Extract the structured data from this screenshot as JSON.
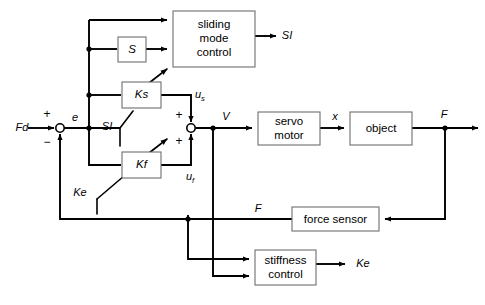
{
  "diagram": {
    "type": "control-system-block-diagram",
    "width": 485,
    "height": 305,
    "background_color": "#ffffff",
    "line_color": "#000000",
    "box_stroke_color": "#6e6e6e",
    "blocks": [
      {
        "id": "sliding-mode-control",
        "label_lines": [
          "sliding",
          "mode",
          "control"
        ],
        "x": 173,
        "y": 11,
        "w": 82,
        "h": 56
      },
      {
        "id": "s-block",
        "label_lines": [
          "S"
        ],
        "x": 118,
        "y": 37,
        "w": 28,
        "h": 25
      },
      {
        "id": "ks-block",
        "label_lines": [
          "Ks"
        ],
        "x": 122,
        "y": 82,
        "w": 39,
        "h": 26
      },
      {
        "id": "kf-block",
        "label_lines": [
          "Kf"
        ],
        "x": 122,
        "y": 152,
        "w": 39,
        "h": 26
      },
      {
        "id": "servo-motor",
        "label_lines": [
          "servo",
          "motor"
        ],
        "x": 258,
        "y": 112,
        "w": 62,
        "h": 33
      },
      {
        "id": "object",
        "label_lines": [
          "object"
        ],
        "x": 350,
        "y": 112,
        "w": 62,
        "h": 33
      },
      {
        "id": "force-sensor",
        "label_lines": [
          "force sensor"
        ],
        "x": 292,
        "y": 207,
        "w": 87,
        "h": 24
      },
      {
        "id": "stiffness-control",
        "label_lines": [
          "stiffness",
          "control"
        ],
        "x": 255,
        "y": 250,
        "w": 61,
        "h": 35
      }
    ],
    "signals": [
      {
        "id": "Fd",
        "label": "Fd",
        "x": 22,
        "y": 128
      },
      {
        "id": "e",
        "label": "e",
        "x": 75,
        "y": 119
      },
      {
        "id": "SI-out",
        "label": "SI",
        "x": 285,
        "y": 36
      },
      {
        "id": "SI-switch",
        "label": "SI",
        "x": 107,
        "y": 127
      },
      {
        "id": "us",
        "label": "u",
        "sub": "s",
        "x": 198,
        "y": 95
      },
      {
        "id": "uf",
        "label": "u",
        "sub": "f",
        "x": 190,
        "y": 177
      },
      {
        "id": "V",
        "label": "V",
        "x": 226,
        "y": 118
      },
      {
        "id": "x",
        "label": "x",
        "x": 335,
        "y": 118
      },
      {
        "id": "F-out",
        "label": "F",
        "x": 444,
        "y": 116
      },
      {
        "id": "F-sensor",
        "label": "F",
        "x": 258,
        "y": 209
      },
      {
        "id": "Ke-switch",
        "label": "Ke",
        "x": 80,
        "y": 193
      },
      {
        "id": "Ke-out",
        "label": "Ke",
        "x": 363,
        "y": 264
      }
    ],
    "sum_junctions": [
      {
        "id": "sum-error",
        "x": 60,
        "y": 128,
        "r": 4,
        "signs": [
          {
            "s": "+",
            "x": 47,
            "y": 116
          },
          {
            "s": "−",
            "x": 47,
            "y": 142
          }
        ]
      },
      {
        "id": "sum-control",
        "x": 191,
        "y": 128,
        "r": 4,
        "signs": [
          {
            "s": "+",
            "x": 178,
            "y": 117
          },
          {
            "s": "+",
            "x": 178,
            "y": 141
          }
        ]
      }
    ],
    "node_dots": [
      {
        "id": "bus-node-s",
        "x": 89,
        "y": 49
      },
      {
        "id": "bus-node-ks",
        "x": 89,
        "y": 95
      },
      {
        "id": "bus-node-e",
        "x": 89,
        "y": 128
      },
      {
        "id": "node-V",
        "x": 213,
        "y": 128
      },
      {
        "id": "node-F",
        "x": 445,
        "y": 128
      },
      {
        "id": "node-fb-lower",
        "x": 188,
        "y": 215
      }
    ],
    "switch_symbols": [
      {
        "id": "ks-variable-gain-arrow",
        "from_x": 133,
        "from_y": 95,
        "to_x": 168,
        "to_y": 70
      },
      {
        "id": "kf-variable-gain-arrow",
        "from_x": 133,
        "from_y": 165,
        "to_x": 168,
        "to_y": 140
      },
      {
        "id": "si-switch-contact",
        "from_x": 120,
        "from_y": 128,
        "to_x": 133,
        "to_y": 112
      },
      {
        "id": "ke-switch-contact",
        "from_x": 97,
        "from_y": 198,
        "to_x": 133,
        "to_y": 172
      }
    ]
  }
}
